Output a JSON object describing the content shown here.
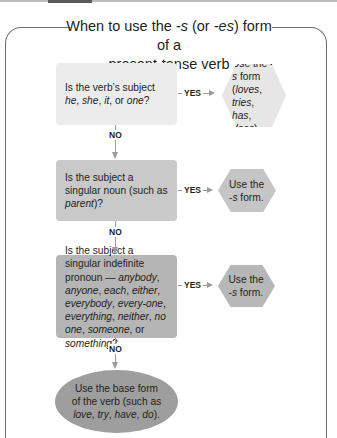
{
  "title": {
    "line1_pre": "When to use the ",
    "line1_s": "-s",
    "line1_mid": " (or ",
    "line1_es": "-es",
    "line1_post": ") form of a",
    "line2": "present-tense verb"
  },
  "colors": {
    "box1": "#ececec",
    "box2": "#c9c9c9",
    "box3": "#b5b5b5",
    "ellipse": "#9e9e9e",
    "connector": "#9a9a9a",
    "frame": "#6e6e6e"
  },
  "decisions": [
    {
      "parts": [
        {
          "t": "Is the verb’s subject ",
          "i": false
        },
        {
          "t": "he",
          "i": true
        },
        {
          "t": ", ",
          "i": false
        },
        {
          "t": "she",
          "i": true
        },
        {
          "t": ", ",
          "i": false
        },
        {
          "t": "it",
          "i": true
        },
        {
          "t": ", or ",
          "i": false
        },
        {
          "t": "one",
          "i": true
        },
        {
          "t": "?",
          "i": false
        }
      ]
    },
    {
      "parts": [
        {
          "t": "Is the subject a singular noun (such as ",
          "i": false
        },
        {
          "t": "parent",
          "i": true
        },
        {
          "t": ")?",
          "i": false
        }
      ]
    },
    {
      "parts": [
        {
          "t": "Is the subject a singular indefinite pronoun — ",
          "i": false
        },
        {
          "t": "anybody",
          "i": true
        },
        {
          "t": ", ",
          "i": false
        },
        {
          "t": "anyone",
          "i": true
        },
        {
          "t": ", ",
          "i": false
        },
        {
          "t": "each",
          "i": true
        },
        {
          "t": ", ",
          "i": false
        },
        {
          "t": "either",
          "i": true
        },
        {
          "t": ", ",
          "i": false
        },
        {
          "t": "everybody",
          "i": true
        },
        {
          "t": ", ",
          "i": false
        },
        {
          "t": "every-one",
          "i": true
        },
        {
          "t": ", ",
          "i": false
        },
        {
          "t": "everything",
          "i": true
        },
        {
          "t": ", ",
          "i": false
        },
        {
          "t": "neither",
          "i": true
        },
        {
          "t": ", ",
          "i": false
        },
        {
          "t": "no one",
          "i": true
        },
        {
          "t": ", ",
          "i": false
        },
        {
          "t": "someone",
          "i": true
        },
        {
          "t": ", or ",
          "i": false
        },
        {
          "t": "something",
          "i": true
        },
        {
          "t": "?",
          "i": false
        }
      ]
    }
  ],
  "outcomes": [
    {
      "parts": [
        {
          "t": "Use the -",
          "i": false
        },
        {
          "t": "s",
          "i": true
        },
        {
          "t": " form (",
          "i": false
        },
        {
          "t": "loves",
          "i": true
        },
        {
          "t": ", ",
          "i": false
        },
        {
          "t": "tries",
          "i": true
        },
        {
          "t": ", ",
          "i": false
        },
        {
          "t": "has",
          "i": true
        },
        {
          "t": ", ",
          "i": false
        },
        {
          "t": "does",
          "i": true
        },
        {
          "t": ").",
          "i": false
        }
      ]
    },
    {
      "parts": [
        {
          "t": "Use the -",
          "i": false
        },
        {
          "t": "s",
          "i": true
        },
        {
          "t": " form.",
          "i": false
        }
      ]
    },
    {
      "parts": [
        {
          "t": "Use the -",
          "i": false
        },
        {
          "t": "s",
          "i": true
        },
        {
          "t": " form.",
          "i": false
        }
      ]
    }
  ],
  "final": {
    "parts": [
      {
        "t": "Use the base form of the verb (such as ",
        "i": false
      },
      {
        "t": "love",
        "i": true
      },
      {
        "t": ", ",
        "i": false
      },
      {
        "t": "try",
        "i": true
      },
      {
        "t": ", ",
        "i": false
      },
      {
        "t": "have",
        "i": true
      },
      {
        "t": ", ",
        "i": false
      },
      {
        "t": "do",
        "i": true
      },
      {
        "t": ").",
        "i": false
      }
    ]
  },
  "labels": {
    "yes": "YES",
    "no": "NO"
  }
}
